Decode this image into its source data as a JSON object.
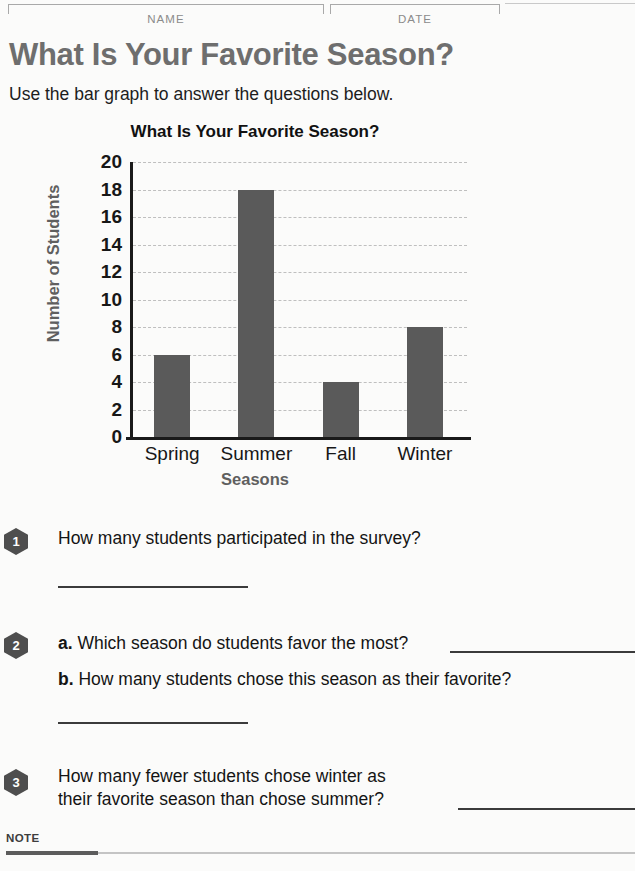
{
  "header": {
    "name_label": "NAME",
    "date_label": "DATE"
  },
  "page": {
    "title": "What Is Your Favorite Season?",
    "subtitle": "Use the bar graph to answer the questions below."
  },
  "chart_data": {
    "type": "bar",
    "title": "What Is Your Favorite Season?",
    "categories": [
      "Spring",
      "Summer",
      "Fall",
      "Winter"
    ],
    "values": [
      6,
      18,
      4,
      8
    ],
    "xlabel": "Seasons",
    "ylabel": "Number of Students",
    "ylim": [
      0,
      20
    ],
    "ytick_step": 2,
    "yticks": [
      20,
      18,
      16,
      14,
      12,
      10,
      8,
      6,
      4,
      2,
      0
    ],
    "grid": true,
    "grid_style": "dashed-horizontal",
    "legend": "none",
    "bar_color": "#5a5a5a",
    "axis_color": "#1a1a1a",
    "gridline_color": "#bfbfbf"
  },
  "questions": [
    {
      "number": "1",
      "text": "How many students participated in the survey?",
      "answer_blank": "short-line-below"
    },
    {
      "number": "2",
      "parts": [
        {
          "label": "a.",
          "text": "Which season do students favor the most?",
          "answer_blank": "inline-trailing"
        },
        {
          "label": "b.",
          "text": "How many students chose this season as their favorite?",
          "answer_blank": "short-line-below"
        }
      ]
    },
    {
      "number": "3",
      "line1": "How many fewer students chose winter as",
      "line2": "their favorite season than chose summer?",
      "answer_blank": "inline-trailing"
    }
  ],
  "footer": {
    "note_label": "NOTE"
  }
}
